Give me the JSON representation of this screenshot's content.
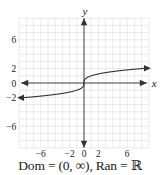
{
  "chart_data": {
    "type": "line",
    "title": "",
    "function": "y = cube root of x",
    "xlabel": "x",
    "ylabel": "y",
    "xlim": [
      -9,
      9
    ],
    "ylim": [
      -9,
      9
    ],
    "grid": true,
    "x_ticks": [
      -6,
      -2,
      0,
      2,
      6
    ],
    "y_ticks": [
      6,
      2,
      0,
      -2,
      -6
    ],
    "x_tick_labels": [
      "−6",
      "−2",
      "0",
      "2",
      "6"
    ],
    "y_tick_labels": [
      "6",
      "2",
      "0",
      "−2",
      "−6"
    ],
    "series": [
      {
        "name": "f(x)",
        "x": [
          -9,
          -8,
          -6,
          -4,
          -2,
          -1,
          -0.5,
          0,
          0.5,
          1,
          2,
          4,
          6,
          8,
          9
        ],
        "y": [
          -2.08,
          -2,
          -1.82,
          -1.59,
          -1.26,
          -1,
          -0.79,
          0,
          0.79,
          1,
          1.26,
          1.59,
          1.82,
          2,
          2.08
        ],
        "color": "#333333",
        "arrows": "both"
      }
    ],
    "annotation": "Dom = (0, ∞), Ran = ℝ"
  },
  "labels": {
    "x_axis": "x",
    "y_axis": "y",
    "caption": "Dom = (0, ∞), Ran = ℝ"
  },
  "colors": {
    "grid": "#dcdcdc",
    "axis": "#333333",
    "curve": "#333333",
    "text": "#222222"
  }
}
